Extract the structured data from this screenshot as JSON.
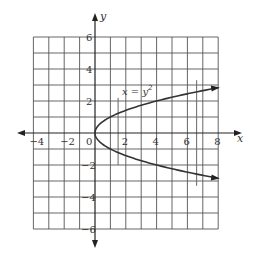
{
  "chart_data": {
    "type": "line",
    "title": "",
    "equation_label": "x = y",
    "equation_exponent": "2",
    "xlabel": "x",
    "ylabel": "y",
    "xlim": [
      -4,
      8
    ],
    "ylim": [
      -6,
      6
    ],
    "grid": true,
    "grid_step": 1,
    "x_tick_labels": [
      "-4",
      "-2",
      "0",
      "2",
      "4",
      "6",
      "8"
    ],
    "x_ticks": [
      -4,
      -2,
      0,
      2,
      4,
      6,
      8
    ],
    "y_tick_labels": [
      "6",
      "4",
      "2",
      "-2",
      "-4",
      "-6"
    ],
    "y_ticks": [
      6,
      4,
      2,
      -2,
      -4,
      -6
    ],
    "series": [
      {
        "name": "x = y^2",
        "curve": "parabola opening right",
        "points": [
          [
            8,
            2.83
          ],
          [
            6.25,
            2.5
          ],
          [
            4,
            2
          ],
          [
            2.25,
            1.5
          ],
          [
            1,
            1
          ],
          [
            0.25,
            0.5
          ],
          [
            0,
            0
          ],
          [
            0.25,
            -0.5
          ],
          [
            1,
            -1
          ],
          [
            2.25,
            -1.5
          ],
          [
            4,
            -2
          ],
          [
            6.25,
            -2.5
          ],
          [
            8,
            -2.83
          ]
        ]
      }
    ],
    "annotations": [
      {
        "type": "vertical-line",
        "x": 1.5,
        "y_from": -2.0,
        "y_to": 2.2
      },
      {
        "type": "vertical-line",
        "x": 6.6,
        "y_from": -3.3,
        "y_to": 3.3
      }
    ]
  },
  "axes": {
    "x_name": "x",
    "y_name": "y",
    "origin_label": "0"
  }
}
